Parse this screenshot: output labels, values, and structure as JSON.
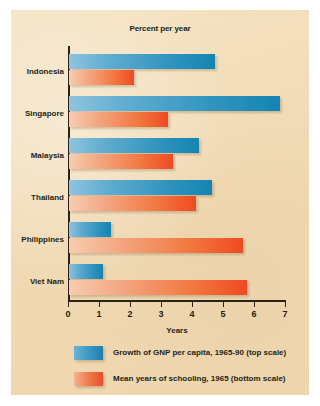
{
  "chart_data": {
    "type": "bar",
    "orientation": "horizontal",
    "title": "Percent per year",
    "xlabel": "Years",
    "ylabel": "",
    "xlim": [
      0,
      7
    ],
    "xticks": [
      0,
      1,
      2,
      3,
      4,
      5,
      6,
      7
    ],
    "grid": false,
    "legend_position": "bottom-left",
    "categories": [
      "Indonesia",
      "Singapore",
      "Malaysia",
      "Thailand",
      "Philippines",
      "Viet Nam"
    ],
    "series": [
      {
        "name": "Growth of GNP per capita, 1965-90 (top scale)",
        "color": "#2f93bd",
        "values": [
          4.7,
          6.8,
          4.2,
          4.6,
          1.35,
          1.1
        ]
      },
      {
        "name": "Mean years of schooling, 1965 (bottom scale)",
        "color": "#ef4a21",
        "values": [
          2.1,
          3.2,
          3.35,
          4.1,
          5.6,
          5.75
        ]
      }
    ]
  },
  "legend": [
    {
      "label": "Growth of GNP per capita, 1965-90 (top scale)",
      "swatch": "gnp"
    },
    {
      "label": "Mean years of schooling, 1965 (bottom scale)",
      "swatch": "school"
    }
  ],
  "colors": {
    "panel_background": "#f2ddb9",
    "axis": "#2a2118",
    "text": "#231f18",
    "blue_light": "#8ec4de",
    "blue_dark": "#1484b2",
    "red_light": "#f7cdb0",
    "red_dark": "#ef4a21"
  }
}
